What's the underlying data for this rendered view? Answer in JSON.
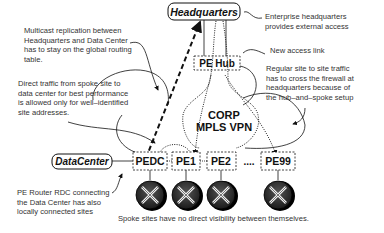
{
  "nodes": {
    "headquarters": "Headquarters",
    "pe_hub": "PE Hub",
    "datacenter": "DataCenter",
    "pedc": "PEDC",
    "pe1": "PE1",
    "pe2": "PE2",
    "ellipsis": "....",
    "pe99": "PE99",
    "cloud_line1": "CORP",
    "cloud_line2": "MPLS VPN"
  },
  "annotations": {
    "multicast": [
      "Multicast replication between",
      "Headquarters and Data Center",
      "has to stay on the global routing",
      "table."
    ],
    "direct_traffic": [
      "Direct traffic from spoke site to",
      "data center for best performance",
      "is allowed only for well–identified",
      "site addresses."
    ],
    "enterprise_hq": [
      "Enterprise headquarters",
      "provides external access"
    ],
    "new_access": [
      "New access link"
    ],
    "regular_traffic": [
      "Regular site to site traffic",
      "has to cross the firewall at",
      "headquarters because of",
      "the hub–and–spoke setup"
    ],
    "pe_router": [
      "PE Router RDC connecting",
      "the Data Center has also",
      "locally connected sites"
    ],
    "spoke_visibility": [
      "Spoke sites have no direct visibility between themselves."
    ]
  }
}
